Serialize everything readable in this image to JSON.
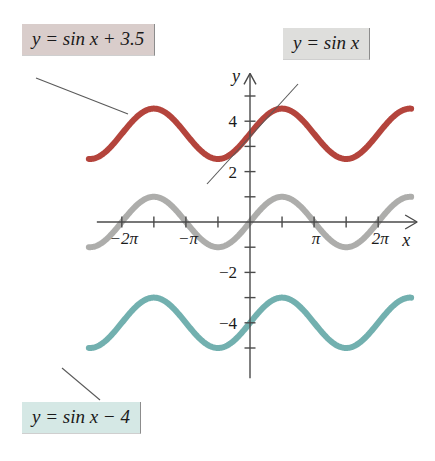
{
  "figure": {
    "background": "#ffffff"
  },
  "callouts": [
    {
      "id": "sin-plus",
      "text": "y = sin x + 3.5",
      "bg": "#d9cdcb",
      "target_curve": "sin_plus_3_5"
    },
    {
      "id": "sin",
      "text": "y = sin x",
      "bg": "#dededc",
      "target_curve": "sin"
    },
    {
      "id": "sin-minus",
      "text": "y = sin x − 4",
      "bg": "#d5e8e5",
      "target_curve": "sin_minus_4"
    }
  ],
  "axes": {
    "x_label": "x",
    "y_label": "y",
    "x_ticks": [
      {
        "value": -6.2832,
        "label": "−2π"
      },
      {
        "value": -4.7124,
        "label": ""
      },
      {
        "value": -3.1416,
        "label": "−π"
      },
      {
        "value": -1.5708,
        "label": ""
      },
      {
        "value": 1.5708,
        "label": ""
      },
      {
        "value": 3.1416,
        "label": "π"
      },
      {
        "value": 4.7124,
        "label": ""
      },
      {
        "value": 6.2832,
        "label": "2π"
      }
    ],
    "y_ticks": [
      {
        "value": 5,
        "label": ""
      },
      {
        "value": 4,
        "label": "4"
      },
      {
        "value": 3,
        "label": ""
      },
      {
        "value": 2,
        "label": "2"
      },
      {
        "value": 1,
        "label": ""
      },
      {
        "value": -1,
        "label": ""
      },
      {
        "value": -2,
        "label": "−2"
      },
      {
        "value": -3,
        "label": ""
      },
      {
        "value": -4,
        "label": "−4"
      },
      {
        "value": -5,
        "label": ""
      }
    ],
    "xlim": [
      -7.9,
      7.9
    ],
    "ylim": [
      -6.2,
      5.8
    ],
    "grid": false
  },
  "chart_data": {
    "type": "line",
    "xlabel": "x",
    "ylabel": "y",
    "xlim": [
      -7.9,
      7.9
    ],
    "ylim": [
      -6.2,
      5.8
    ],
    "grid": false,
    "legend_position": "callout-boxes",
    "x_tick_labels": [
      "−2π",
      "−π",
      "π",
      "2π"
    ],
    "x_tick_values": [
      -6.2832,
      -3.1416,
      3.1416,
      6.2832
    ],
    "y_tick_labels": [
      "4",
      "2",
      "−2",
      "−4"
    ],
    "y_tick_values": [
      4,
      2,
      -2,
      -4
    ],
    "series": [
      {
        "name": "y = sin x + 3.5",
        "formula": "sin(x) + 3.5",
        "color": "#b03a31",
        "linewidth": 6,
        "amplitude": 1,
        "period": 6.2832,
        "vertical_shift": 3.5,
        "midline": 3.5,
        "max": 4.5,
        "min": 2.5
      },
      {
        "name": "y = sin x",
        "formula": "sin(x)",
        "color": "#a9a9a6",
        "linewidth": 6,
        "amplitude": 1,
        "period": 6.2832,
        "vertical_shift": 0,
        "midline": 0,
        "max": 1,
        "min": -1
      },
      {
        "name": "y = sin x − 4",
        "formula": "sin(x) - 4",
        "color": "#6aacab",
        "linewidth": 6,
        "amplitude": 1,
        "period": 6.2832,
        "vertical_shift": -4,
        "midline": -4,
        "max": -3,
        "min": -5
      }
    ]
  },
  "colors": {
    "red_curve": "#b03a31",
    "gray_curve": "#a9a9a6",
    "teal_curve": "#6aacab",
    "axis": "#4a4a4a",
    "leader_line": "#5a5a5a",
    "text": "#1a1a1a"
  }
}
